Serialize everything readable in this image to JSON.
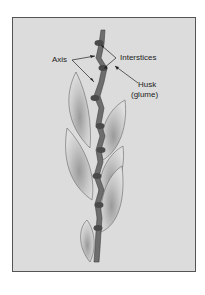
{
  "diagram": {
    "type": "labeled botanical illustration",
    "labels": {
      "axis": "Axis",
      "interstices": "Interstices",
      "husk_line1": "Husk",
      "husk_line2": "(glume)"
    },
    "colors": {
      "background": "#dcdcdc",
      "frame_border": "#555555",
      "stem": "#6e6e6e",
      "stem_dark": "#4a4a4a",
      "husk_fill": "#d2d2d2",
      "husk_outline": "#666666",
      "leader_line": "#222222"
    }
  }
}
